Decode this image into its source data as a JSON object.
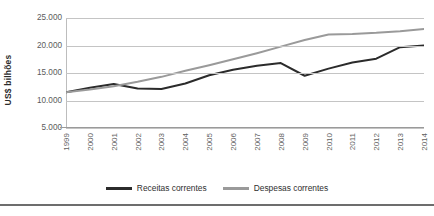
{
  "chart_data": {
    "type": "line",
    "title": "",
    "subtitle": "",
    "xlabel": "",
    "ylabel": "US$ bilhões",
    "categories": [
      "1999",
      "2000",
      "2001",
      "2002",
      "2003",
      "2004",
      "2005",
      "2006",
      "2007",
      "2008",
      "2009",
      "2010",
      "2011",
      "2012",
      "2013",
      "2014"
    ],
    "ylim": [
      0,
      25000
    ],
    "ytick_labels": [
      "25.000",
      "20.000",
      "15.000",
      "10.000",
      "5.000"
    ],
    "ytick_values": [
      25000,
      20000,
      15000,
      10000,
      5000
    ],
    "grid": true,
    "legend_position": "bottom",
    "series": [
      {
        "name": "Receitas correntes",
        "color": "#2b2b2b",
        "values": [
          11500,
          12300,
          13000,
          12200,
          12100,
          13100,
          14600,
          15600,
          16300,
          16800,
          14500,
          15800,
          16900,
          17600,
          19700,
          20000
        ]
      },
      {
        "name": "Despesas correntes",
        "color": "#9a9a9a",
        "values": [
          11500,
          12000,
          12600,
          13400,
          14300,
          15400,
          16400,
          17500,
          18600,
          19800,
          21000,
          22000,
          22100,
          22300,
          22600,
          23000
        ]
      }
    ]
  },
  "axis": {
    "y_title": "US$ bilhões"
  },
  "legend": {
    "items": [
      {
        "label": "Receitas correntes",
        "color": "#2b2b2b"
      },
      {
        "label": "Despesas correntes",
        "color": "#9a9a9a"
      }
    ]
  },
  "caption": {
    "text": ""
  }
}
